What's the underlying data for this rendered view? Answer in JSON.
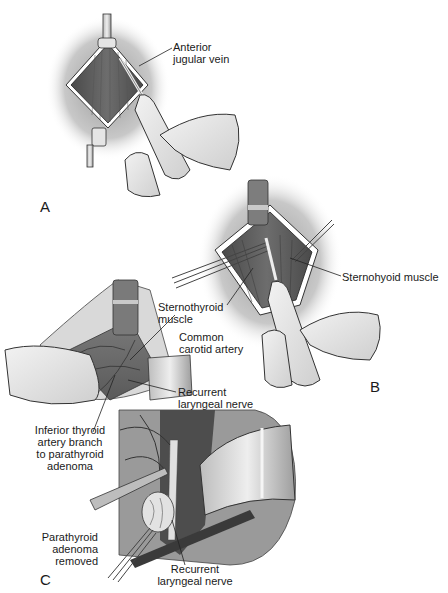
{
  "figure": {
    "panels": [
      {
        "id": "A",
        "letter": "A",
        "labels": [
          {
            "text": "Anterior\njugular vein"
          }
        ]
      },
      {
        "id": "B",
        "letter": "B",
        "labels": [
          {
            "text": "Sternohyoid muscle"
          },
          {
            "text": "Sternothyroid\nmuscle"
          }
        ]
      },
      {
        "id": "C",
        "letter": "C",
        "labels": [
          {
            "text": "Common\ncarotid artery"
          },
          {
            "text": "Recurrent\nlaryngeal nerve"
          },
          {
            "text": "Inferior thyroid\nartery branch\nto parathyroid\nadenoma"
          },
          {
            "text": "Parathyroid\nadenoma\nremoved"
          },
          {
            "text": "Recurrent\nlaryngeal nerve"
          }
        ]
      }
    ]
  }
}
